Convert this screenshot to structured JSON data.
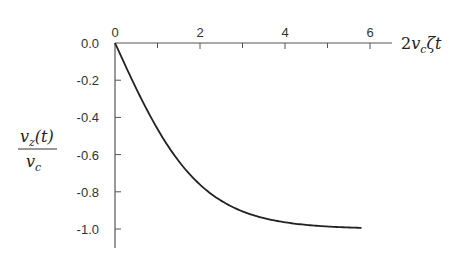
{
  "chart_data": {
    "type": "line",
    "title": "",
    "xlabel": "2v_c ζ t",
    "ylabel": "v_z(t) / v_c",
    "xlim": [
      0,
      6.4
    ],
    "ylim": [
      -1.1,
      0.0
    ],
    "grid": false,
    "legend": null,
    "x_ticks": [
      0,
      2,
      4,
      6
    ],
    "x_tick_labels": [
      "0",
      "2",
      "4",
      "6"
    ],
    "x_minor_ticks": [
      1,
      3,
      5
    ],
    "y_ticks": [
      0.0,
      -0.2,
      -0.4,
      -0.6,
      -0.8,
      -1.0
    ],
    "y_tick_labels": [
      "0.0",
      "-0.2",
      "-0.4",
      "-0.6",
      "-0.8",
      "-1.0"
    ],
    "series": [
      {
        "name": "v_z(t)/v_c",
        "function": "-tanh(x/2)",
        "x": [
          0,
          0.5,
          1,
          1.5,
          2,
          2.5,
          3,
          3.5,
          4,
          4.5,
          5,
          5.5,
          5.8
        ],
        "values": [
          0.0,
          -0.245,
          -0.462,
          -0.635,
          -0.762,
          -0.848,
          -0.905,
          -0.941,
          -0.964,
          -0.978,
          -0.987,
          -0.992,
          -0.994
        ]
      }
    ],
    "color": "#222222"
  },
  "labels": {
    "x_axis_main": "2",
    "x_axis_v": "v",
    "x_axis_sub": "c",
    "x_axis_rest": "ζt",
    "y_num_v": "v",
    "y_num_sub": "z",
    "y_num_rest": "(t)",
    "y_den_v": "v",
    "y_den_sub": "c"
  }
}
